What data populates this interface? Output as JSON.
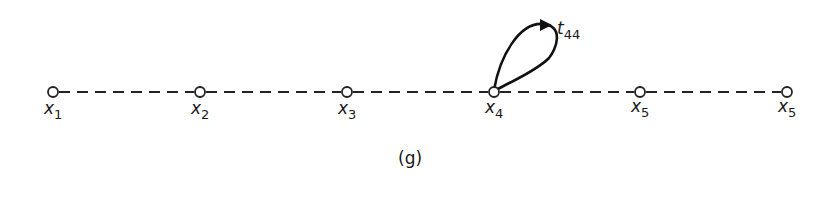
{
  "diagram": {
    "caption": "(g)",
    "nodes": [
      {
        "id": "x1",
        "base": "x",
        "sub": "1",
        "cx": 53,
        "cy": 92
      },
      {
        "id": "x2",
        "base": "x",
        "sub": "2",
        "cx": 200,
        "cy": 92
      },
      {
        "id": "x3",
        "base": "x",
        "sub": "3",
        "cx": 347,
        "cy": 92
      },
      {
        "id": "x4",
        "base": "x",
        "sub": "4",
        "cx": 494,
        "cy": 92
      },
      {
        "id": "x5a",
        "base": "x",
        "sub": "5",
        "cx": 640,
        "cy": 92
      },
      {
        "id": "x5b",
        "base": "x",
        "sub": "5",
        "cx": 787,
        "cy": 92
      }
    ],
    "edges": [
      {
        "from": "x1",
        "to": "x2",
        "style": "dashed"
      },
      {
        "from": "x2",
        "to": "x3",
        "style": "dashed"
      },
      {
        "from": "x3",
        "to": "x4",
        "style": "dashed"
      },
      {
        "from": "x4",
        "to": "x5a",
        "style": "dashed"
      },
      {
        "from": "x5a",
        "to": "x5b",
        "style": "dashed"
      }
    ],
    "self_loop": {
      "node": "x4",
      "label_base": "t",
      "label_sub": "44"
    }
  }
}
